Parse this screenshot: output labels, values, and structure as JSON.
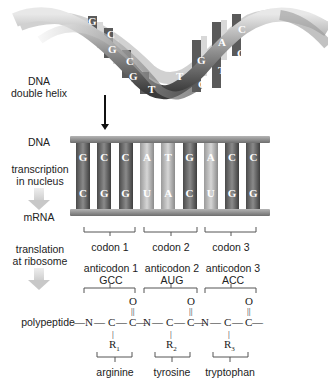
{
  "labels": {
    "helix": [
      "DNA",
      "double helix"
    ],
    "dna": "DNA",
    "transcription": [
      "transcription",
      "in nucleus"
    ],
    "mrna": "mRNA",
    "translation": [
      "translation",
      "at ribosome"
    ],
    "polypeptide": "polypeptide"
  },
  "helix_bases": [
    "G",
    "C",
    "G",
    "C",
    "G",
    "T",
    "T",
    "C",
    "G",
    "T",
    "A",
    "C",
    "G",
    "G"
  ],
  "dna_strand": [
    "G",
    "C",
    "C",
    "A",
    "T",
    "G",
    "A",
    "C",
    "C"
  ],
  "mrna_strand": [
    "C",
    "G",
    "G",
    "U",
    "A",
    "C",
    "U",
    "G",
    "G"
  ],
  "codons": [
    {
      "label": "codon 1",
      "anticodon_label": "anticodon 1",
      "anticodon": "GCC",
      "r_group": "R",
      "r_sub": "1",
      "amino_acid": "arginine"
    },
    {
      "label": "codon 2",
      "anticodon_label": "anticodon 2",
      "anticodon": "AUG",
      "r_group": "R",
      "r_sub": "2",
      "amino_acid": "tyrosine"
    },
    {
      "label": "codon 3",
      "anticodon_label": "anticodon 3",
      "anticodon": "ACC",
      "r_group": "R",
      "r_sub": "3",
      "amino_acid": "tryptophan"
    }
  ],
  "backbone": {
    "N": "N",
    "C": "C",
    "O": "O"
  },
  "colors": {
    "rung_dark": "#6b6b6b",
    "rung_light": "#c9c9c9",
    "rail": "#8a8a8a",
    "arrow_gray": "#cfcfcf"
  }
}
